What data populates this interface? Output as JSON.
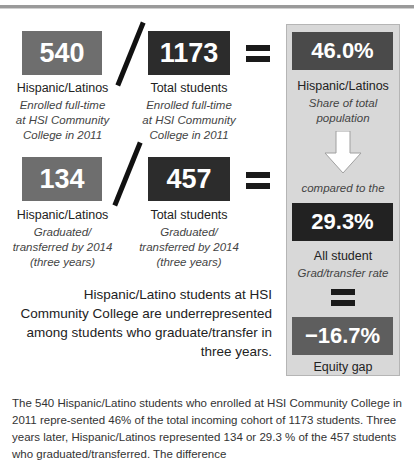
{
  "colors": {
    "hispanic_box": "#6e6e6e",
    "total_box": "#2c2c2c",
    "panel_bg": "#d8d8d8",
    "gap_box": "#5e5e5e"
  },
  "row1": {
    "hispanic": {
      "value": "540",
      "label": "Hispanic/Latinos",
      "sub": [
        "Enrolled full-time",
        "at HSI Community",
        "College in 2011"
      ]
    },
    "total": {
      "value": "1173",
      "label": "Total students",
      "sub": [
        "Enrolled full-time",
        "at HSI Community",
        "College in 2011"
      ]
    }
  },
  "row2": {
    "hispanic": {
      "value": "134",
      "label": "Hispanic/Latinos",
      "sub": [
        "Graduated/",
        "transferred by 2014",
        "(three years)"
      ]
    },
    "total": {
      "value": "457",
      "label": "Total students",
      "sub": [
        "Graduated/",
        "transferred by 2014",
        "(three years)"
      ]
    }
  },
  "panel": {
    "share": {
      "value": "46.0%",
      "label": "Hispanic/Latinos",
      "sub": [
        "Share of total",
        "population"
      ]
    },
    "compared": "compared to the",
    "rate": {
      "value": "29.3%",
      "label": "All student",
      "sub": "Grad/transfer rate"
    },
    "gap": {
      "value": "−16.7%",
      "label": "Equity gap"
    }
  },
  "statement": "Hispanic/Latino students at HSI Community College are underrepresented among students who graduate/transfer in three years.",
  "paragraph": "The 540 Hispanic/Latino students who enrolled at HSI Community College in 2011 repre-sented 46% of the total incoming cohort of 1173 students. Three years later, Hispanic/Latinos represented 134 or 29.3 % of the 457 students who graduated/transferred. The difference"
}
